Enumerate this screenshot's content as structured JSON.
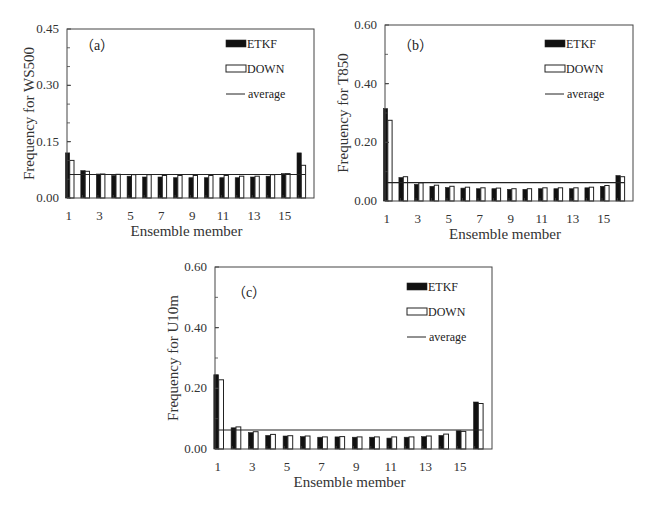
{
  "chart_data": [
    {
      "type": "bar",
      "panel_label": "（a）",
      "title": "",
      "xlabel": "Ensemble member",
      "ylabel": "Frequency for  WS500",
      "ylim": [
        0,
        0.45
      ],
      "yticks": [
        0.0,
        0.15,
        0.3,
        0.45
      ],
      "ytick_labels": [
        "0.00",
        "0.15",
        "0.30",
        "0.45"
      ],
      "y_minor_step": 0.05,
      "categories": [
        1,
        2,
        3,
        4,
        5,
        6,
        7,
        8,
        9,
        10,
        11,
        12,
        13,
        14,
        15,
        16
      ],
      "xtick_labels": [
        "1",
        "3",
        "5",
        "7",
        "9",
        "11",
        "13",
        "15"
      ],
      "legend_position": "top-right",
      "series": [
        {
          "name": "ETKF",
          "style": "filled",
          "values": [
            0.12,
            0.073,
            0.064,
            0.06,
            0.058,
            0.056,
            0.056,
            0.054,
            0.054,
            0.054,
            0.054,
            0.054,
            0.056,
            0.058,
            0.065,
            0.12
          ]
        },
        {
          "name": "DOWN",
          "style": "outline",
          "values": [
            0.1,
            0.071,
            0.064,
            0.063,
            0.062,
            0.062,
            0.06,
            0.06,
            0.06,
            0.06,
            0.06,
            0.058,
            0.058,
            0.062,
            0.065,
            0.087
          ]
        }
      ],
      "average": {
        "name": "average",
        "value": 0.0625
      }
    },
    {
      "type": "bar",
      "panel_label": "（b）",
      "title": "",
      "xlabel": "Ensemble member",
      "ylabel": "Frequency for T850",
      "ylim": [
        0,
        0.6
      ],
      "yticks": [
        0.0,
        0.2,
        0.4,
        0.6
      ],
      "ytick_labels": [
        "0.00",
        "0.20",
        "0.40",
        "0.60"
      ],
      "y_minor_step": 0.1,
      "categories": [
        1,
        2,
        3,
        4,
        5,
        6,
        7,
        8,
        9,
        10,
        11,
        12,
        13,
        14,
        15,
        16
      ],
      "xtick_labels": [
        "1",
        "3",
        "5",
        "7",
        "9",
        "11",
        "13",
        "15"
      ],
      "legend_position": "top-right",
      "series": [
        {
          "name": "ETKF",
          "style": "filled",
          "values": [
            0.315,
            0.08,
            0.057,
            0.05,
            0.046,
            0.044,
            0.042,
            0.042,
            0.04,
            0.04,
            0.042,
            0.042,
            0.042,
            0.045,
            0.05,
            0.087
          ]
        },
        {
          "name": "DOWN",
          "style": "outline",
          "values": [
            0.275,
            0.083,
            0.062,
            0.054,
            0.05,
            0.047,
            0.045,
            0.044,
            0.042,
            0.042,
            0.045,
            0.045,
            0.045,
            0.047,
            0.053,
            0.083
          ]
        }
      ],
      "average": {
        "name": "average",
        "value": 0.0625
      }
    },
    {
      "type": "bar",
      "panel_label": "（c）",
      "title": "",
      "xlabel": "Ensemble member",
      "ylabel": "Frequency for U10m",
      "ylim": [
        0,
        0.6
      ],
      "yticks": [
        0.0,
        0.2,
        0.4,
        0.6
      ],
      "ytick_labels": [
        "0.00",
        "0.20",
        "0.40",
        "0.60"
      ],
      "y_minor_step": 0.1,
      "categories": [
        1,
        2,
        3,
        4,
        5,
        6,
        7,
        8,
        9,
        10,
        11,
        12,
        13,
        14,
        15,
        16
      ],
      "xtick_labels": [
        "1",
        "3",
        "5",
        "7",
        "9",
        "11",
        "13",
        "15"
      ],
      "legend_position": "top-right",
      "series": [
        {
          "name": "ETKF",
          "style": "filled",
          "values": [
            0.245,
            0.07,
            0.054,
            0.045,
            0.043,
            0.041,
            0.039,
            0.04,
            0.039,
            0.039,
            0.036,
            0.039,
            0.041,
            0.045,
            0.06,
            0.155
          ]
        },
        {
          "name": "DOWN",
          "style": "outline",
          "values": [
            0.228,
            0.073,
            0.057,
            0.048,
            0.044,
            0.043,
            0.04,
            0.041,
            0.04,
            0.04,
            0.04,
            0.04,
            0.043,
            0.049,
            0.058,
            0.15
          ]
        }
      ],
      "average": {
        "name": "average",
        "value": 0.0625
      }
    }
  ],
  "colors": {
    "etkf_fill": "#111111",
    "down_fill": "#ffffff",
    "stroke": "#222222",
    "axis": "#444444"
  }
}
